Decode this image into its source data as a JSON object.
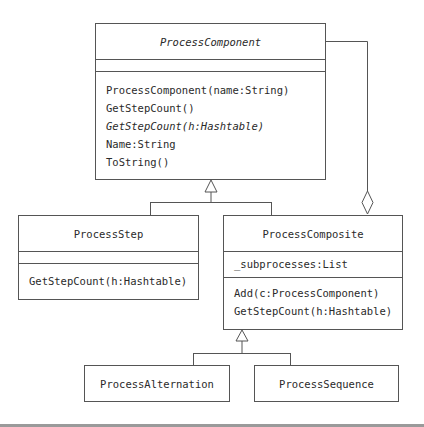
{
  "diagram": {
    "type": "UML class diagram",
    "classes": {
      "process_component": {
        "name": "ProcessComponent",
        "abstract": true,
        "attributes": [],
        "operations": [
          {
            "label": "ProcessComponent(name:String)",
            "italic": false
          },
          {
            "label": "GetStepCount()",
            "italic": false
          },
          {
            "label": "GetStepCount(h:Hashtable)",
            "italic": true
          },
          {
            "label": "Name:String",
            "italic": false
          },
          {
            "label": "ToString()",
            "italic": false
          }
        ]
      },
      "process_step": {
        "name": "ProcessStep",
        "attributes": [],
        "operations": [
          {
            "label": "GetStepCount(h:Hashtable)"
          }
        ]
      },
      "process_composite": {
        "name": "ProcessComposite",
        "attributes": [
          {
            "label": "_subprocesses:List"
          }
        ],
        "operations": [
          {
            "label": "Add(c:ProcessComponent)"
          },
          {
            "label": "GetStepCount(h:Hashtable)"
          }
        ]
      },
      "process_alternation": {
        "name": "ProcessAlternation"
      },
      "process_sequence": {
        "name": "ProcessSequence"
      }
    },
    "relationships": [
      {
        "type": "generalization",
        "from": "ProcessStep",
        "to": "ProcessComponent"
      },
      {
        "type": "generalization",
        "from": "ProcessComposite",
        "to": "ProcessComponent"
      },
      {
        "type": "aggregation",
        "whole": "ProcessComposite",
        "part": "ProcessComponent"
      },
      {
        "type": "generalization",
        "from": "ProcessAlternation",
        "to": "ProcessComposite"
      },
      {
        "type": "generalization",
        "from": "ProcessSequence",
        "to": "ProcessComposite"
      }
    ],
    "colors": {
      "line": "#555555",
      "text": "#2a2a2a",
      "background": "#ffffff",
      "bottom_bar": "#9a9a9a"
    }
  }
}
